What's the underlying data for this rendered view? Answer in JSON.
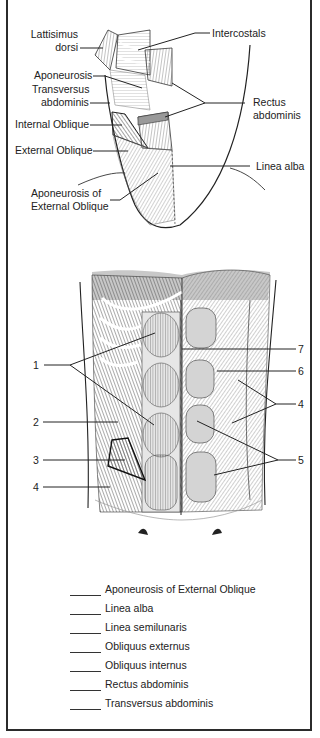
{
  "figure_top": {
    "labels": {
      "lattisimus_line1": "Lattisimus",
      "lattisimus_line2": "dorsi",
      "intercostals": "Intercostals",
      "aponeurosis": "Aponeurosis",
      "transversus_line1": "Transversus",
      "transversus_line2": "abdominis",
      "rectus_line1": "Rectus",
      "rectus_line2": "abdominis",
      "internal_oblique": "Internal Oblique",
      "external_oblique": "External Oblique",
      "linea_alba": "Linea alba",
      "aponeurosis_ext_line1": "Aponeurosis of",
      "aponeurosis_ext_line2": "External Oblique"
    }
  },
  "figure_bottom": {
    "numbers_left": [
      "1",
      "2",
      "3",
      "4"
    ],
    "numbers_right": [
      "7",
      "6",
      "4",
      "5"
    ]
  },
  "legend": {
    "items": [
      "Aponeurosis of External Oblique",
      "Linea alba",
      "Linea semilunaris",
      "Obliquus externus",
      "Obliquus internus",
      "Rectus abdominis",
      "Transversus abdominis"
    ]
  }
}
